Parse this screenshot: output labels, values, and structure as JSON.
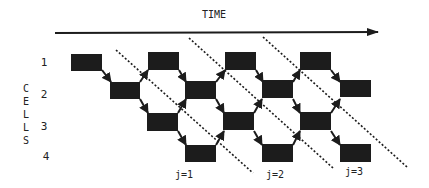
{
  "diagram": {
    "time_label": "TIME",
    "cells_label": [
      "C",
      "E",
      "L",
      "L",
      "S"
    ],
    "cell_numbers": [
      "1",
      "2",
      "3",
      "4"
    ],
    "wavefront_labels": [
      "j=1",
      "j=2",
      "j=3"
    ],
    "colors": {
      "ink": "#1c1c1c",
      "background": "#ffffff"
    },
    "rows": [
      {
        "cell": "1",
        "blocks": 4
      },
      {
        "cell": "2",
        "blocks": 4
      },
      {
        "cell": "3",
        "blocks": 3
      },
      {
        "cell": "4",
        "blocks": 3
      }
    ]
  }
}
